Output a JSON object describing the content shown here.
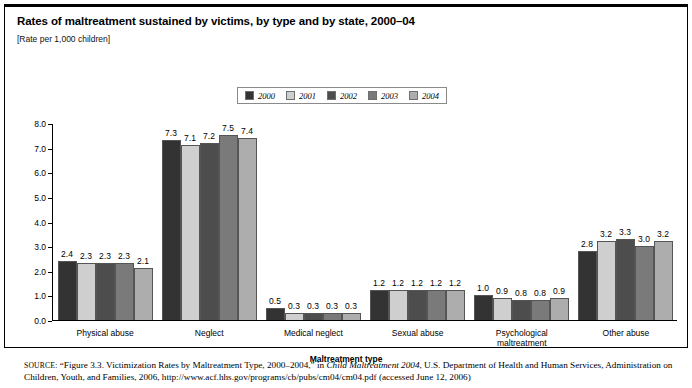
{
  "figure": {
    "title": "Rates of maltreatment sustained by victims, by type and by state, 2000–04",
    "subtitle": "[Rate per 1,000 children]",
    "xaxis_title": "Maltreatment type"
  },
  "source": {
    "label": "SOURCE:",
    "text_1": " “Figure 3.3. Victimization Rates by Maltreatment Type, 2000–2004,” in ",
    "italic_1": "Child Maltreatment 2004",
    "text_2": ", U.S. Department of Health and Human Services, Administration on Children, Youth, and Families, 2006, http://www.acf.hhs.gov/programs/cb/pubs/cm04/cm04.pdf (accessed June 12, 2006)"
  },
  "chart_data": {
    "type": "bar",
    "title": "Rates of maltreatment sustained by victims, by type and by state, 2000–04",
    "subtitle": "[Rate per 1,000 children]",
    "xlabel": "Maltreatment type",
    "ylabel": "",
    "ylim": [
      0.0,
      8.0
    ],
    "yticks": [
      "0.0",
      "1.0",
      "2.0",
      "3.0",
      "4.0",
      "5.0",
      "6.0",
      "7.0",
      "8.0"
    ],
    "grid": false,
    "legend_position": "top-center",
    "categories": [
      "Physical abuse",
      "Neglect",
      "Medical neglect",
      "Sexual abuse",
      "Psychological maltreatment",
      "Other abuse"
    ],
    "series": [
      {
        "name": "2000",
        "color": "#333333",
        "values": [
          2.4,
          7.3,
          0.5,
          1.2,
          1.0,
          2.8
        ],
        "labels": [
          "2.4",
          "7.3",
          "0.5",
          "1.2",
          "1.0",
          "2.8"
        ]
      },
      {
        "name": "2001",
        "color": "#cfcfcf",
        "values": [
          2.3,
          7.1,
          0.3,
          1.2,
          0.9,
          3.2
        ],
        "labels": [
          "2.3",
          "7.1",
          "0.3",
          "1.2",
          "0.9",
          "3.2"
        ]
      },
      {
        "name": "2002",
        "color": "#4d4d4d",
        "values": [
          2.3,
          7.2,
          0.3,
          1.2,
          0.8,
          3.3
        ],
        "labels": [
          "2.3",
          "7.2",
          "0.3",
          "1.2",
          "0.8",
          "3.3"
        ]
      },
      {
        "name": "2003",
        "color": "#7a7a7a",
        "values": [
          2.3,
          7.5,
          0.3,
          1.2,
          0.8,
          3.0
        ],
        "labels": [
          "2.3",
          "7.5",
          "0.3",
          "1.2",
          "0.8",
          "3.0"
        ]
      },
      {
        "name": "2004",
        "color": "#adadad",
        "values": [
          2.1,
          7.4,
          0.3,
          1.2,
          0.9,
          3.2
        ],
        "labels": [
          "2.1",
          "7.4",
          "0.3",
          "1.2",
          "0.9",
          "3.2"
        ]
      }
    ]
  }
}
